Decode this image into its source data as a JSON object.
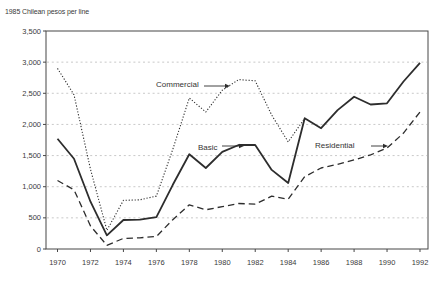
{
  "title": "1985 Chilean pesos per line",
  "chart_data": {
    "type": "line",
    "title": "1985 Chilean pesos per line",
    "xlabel": "",
    "ylabel": "1985 Chilean pesos per line",
    "ylim": [
      0,
      3500
    ],
    "y_ticks": [
      0,
      500,
      1000,
      1500,
      2000,
      2500,
      3000,
      3500
    ],
    "y_tick_labels": [
      "0",
      "500",
      "1,000",
      "1,500",
      "2,000",
      "2,500",
      "3,000",
      "3,500"
    ],
    "x_ticks": [
      1970,
      1972,
      1974,
      1976,
      1978,
      1980,
      1982,
      1984,
      1986,
      1988,
      1990,
      1992
    ],
    "x_tick_labels": [
      "1970",
      "1972",
      "1974",
      "1976",
      "1978",
      "1980",
      "1982",
      "1984",
      "1986",
      "1988",
      "1990",
      "1992"
    ],
    "grid": "horizontal dashed gridlines every 500",
    "legend_position": "inline labels with arrows",
    "x": [
      1970,
      1971,
      1972,
      1973,
      1974,
      1975,
      1976,
      1977,
      1978,
      1979,
      1980,
      1981,
      1982,
      1983,
      1984,
      1985,
      1986,
      1987,
      1988,
      1989,
      1990,
      1991,
      1992
    ],
    "series": [
      {
        "name": "Commercial",
        "line_style": "dotted",
        "values": [
          2900,
          2475,
          1280,
          300,
          780,
          790,
          850,
          1600,
          2425,
          2200,
          2550,
          2720,
          2700,
          2150,
          1720,
          2100,
          null,
          null,
          null,
          null,
          null,
          null,
          null
        ],
        "note": "dotted line merges with Basic line at 1985 and is not separately visible afterwards"
      },
      {
        "name": "Basic",
        "line_style": "solid",
        "values": [
          1770,
          1450,
          760,
          220,
          465,
          470,
          510,
          1030,
          1520,
          1300,
          1560,
          1670,
          1670,
          1270,
          1060,
          2100,
          1940,
          2230,
          2445,
          2320,
          2340,
          2690,
          2990
        ]
      },
      {
        "name": "Residential",
        "line_style": "dashed",
        "values": [
          1100,
          950,
          370,
          60,
          170,
          180,
          200,
          470,
          710,
          630,
          680,
          730,
          720,
          850,
          800,
          1160,
          1300,
          1360,
          1430,
          1510,
          1620,
          1860,
          2200
        ]
      }
    ],
    "annotations": [
      {
        "label": "Commercial",
        "text_x": 156,
        "text_baseline": 87,
        "arrow_x1": 204,
        "arrow_tip": 230,
        "arrow_y": 86
      },
      {
        "label": "Basic",
        "text_x": 198,
        "text_baseline": 150,
        "arrow_x1": 222,
        "arrow_tip": 244,
        "arrow_y": 146
      },
      {
        "label": "Residential",
        "text_x": 315,
        "text_baseline": 148,
        "arrow_x1": 371,
        "arrow_tip": 388,
        "arrow_y": 146
      }
    ]
  },
  "colors": {
    "line": "#2d2d2d",
    "grid": "#c3c3c3",
    "axis": "#474747",
    "text": "#3a3a3a",
    "background": "#ffffff"
  }
}
